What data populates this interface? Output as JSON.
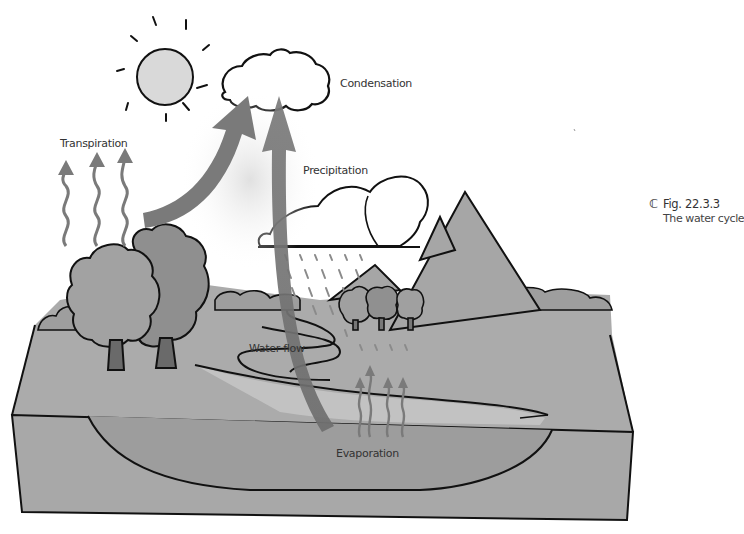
{
  "figure": {
    "number": "Fig. 22.3.3",
    "title": "The water cycle",
    "caption_icon": "cloud-c-icon"
  },
  "labels": {
    "condensation": "Condensation",
    "transpiration": "Transpiration",
    "precipitation": "Precipitation",
    "water_flow": "Water flow",
    "evaporation": "Evaporation"
  },
  "colors": {
    "ground": "#a9a9a9",
    "ground_dark": "#9b9b9b",
    "water": "#c4c4c4",
    "arrow": "#7a7a7a",
    "sun": "#d9d9d9",
    "outline": "#111111",
    "tree": "#8f8f8f",
    "mountain": "#a5a5a5"
  }
}
